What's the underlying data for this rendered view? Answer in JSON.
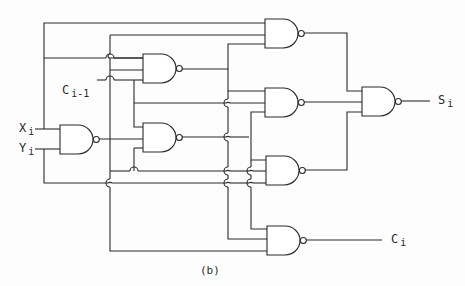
{
  "diagram": {
    "type": "logic-circuit",
    "caption": "(b)",
    "inputs": [
      {
        "name": "X",
        "sub": "i"
      },
      {
        "name": "Y",
        "sub": "i"
      },
      {
        "name": "C",
        "sub": "i-1"
      }
    ],
    "outputs": [
      {
        "name": "S",
        "sub": "i"
      },
      {
        "name": "C",
        "sub": "i"
      }
    ],
    "gate_type": "NAND",
    "gate_count": 8,
    "colors": {
      "line": "#2a2a2a",
      "background": "#ffffff"
    }
  }
}
